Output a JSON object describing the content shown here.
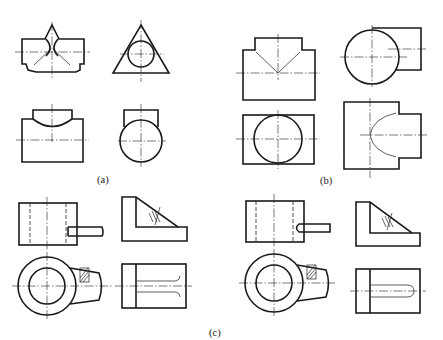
{
  "figure": {
    "captions": {
      "a": "(a)",
      "b": "(b)",
      "c": "(c)"
    },
    "groups": [
      {
        "id": "a",
        "views": [
          {
            "name": "front-view",
            "description": "T-shaped block with V-notch top and intersecting cylinder curves"
          },
          {
            "name": "side-view",
            "description": "Triangle with inscribed circle"
          },
          {
            "name": "top-view",
            "description": "Stepped block with arc intersection curve"
          },
          {
            "name": "side-view-2",
            "description": "Circle with rectangular boss on top"
          }
        ]
      },
      {
        "id": "b",
        "views": [
          {
            "name": "front-view",
            "description": "T-block with diagonal intersection lines"
          },
          {
            "name": "side-view",
            "description": "Circle with rectangular branch to the right"
          },
          {
            "name": "top-view",
            "description": "Rectangle with inscribed circle"
          },
          {
            "name": "side-view-2",
            "description": "Stepped block with curved intersection line"
          }
        ]
      },
      {
        "id": "c",
        "variants": [
          {
            "name": "variant-left",
            "views": [
              "front-view with pin and hidden lines",
              "L-bracket with hatched section",
              "ring with lug and hatched section",
              "rectangle with slot ending in flared lines"
            ]
          },
          {
            "name": "variant-right",
            "views": [
              "front-view with pin and hidden lines",
              "L-bracket with hatched section",
              "ring with lug and hatched section",
              "rectangle with slot ending in rounded end"
            ]
          }
        ]
      }
    ],
    "colors": {
      "line": "#1a1a1a",
      "background": "#ffffff"
    }
  }
}
